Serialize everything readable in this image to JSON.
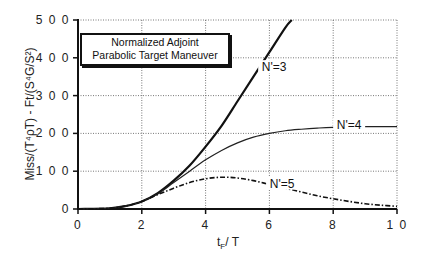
{
  "chart_data": {
    "type": "line",
    "title": "Normalized Adjoint Parabolic Target Maneuver",
    "title_lines": [
      "Normalized Adjoint",
      "Parabolic Target Maneuver"
    ],
    "xlabel": "t_F / T",
    "ylabel": "Miss/(T^4 ρ_T) - Ft/(S^4 G/S^2)",
    "xlim": [
      0,
      10
    ],
    "ylim": [
      0,
      500
    ],
    "xticks": [
      0,
      2,
      4,
      6,
      8,
      10
    ],
    "xtick_labels": [
      "0",
      "2",
      "4",
      "6",
      "8",
      "1 0"
    ],
    "yticks": [
      0,
      100,
      200,
      300,
      400,
      500
    ],
    "ytick_labels": [
      "0",
      "1 0 0",
      "2 0 0",
      "3 0 0",
      "4 0 0",
      "5 0 0"
    ],
    "grid": true,
    "legend": "inline curve labels",
    "series": [
      {
        "name": "N'=3",
        "style": "solid-thick",
        "x": [
          0,
          1,
          1.5,
          2,
          2.5,
          3,
          3.5,
          4,
          4.5,
          5,
          5.5,
          6,
          6.5,
          6.7
        ],
        "values": [
          0,
          2,
          8,
          20,
          42,
          75,
          115,
          165,
          220,
          285,
          350,
          415,
          480,
          500
        ]
      },
      {
        "name": "N'=4",
        "style": "solid-thin",
        "x": [
          0,
          1,
          1.5,
          2,
          2.5,
          3,
          3.5,
          4,
          4.5,
          5,
          5.5,
          6,
          6.5,
          7,
          7.5,
          8,
          9,
          10
        ],
        "values": [
          0,
          2,
          8,
          20,
          40,
          70,
          100,
          130,
          155,
          175,
          190,
          200,
          207,
          211,
          214,
          216,
          218,
          218
        ]
      },
      {
        "name": "N'=5",
        "style": "dash-dot",
        "x": [
          0,
          1,
          1.5,
          2,
          2.5,
          3,
          3.5,
          4,
          4.5,
          5,
          5.5,
          6,
          6.5,
          7,
          7.5,
          8,
          8.5,
          9,
          9.5,
          10
        ],
        "values": [
          0,
          2,
          8,
          20,
          38,
          55,
          70,
          80,
          84,
          82,
          75,
          65,
          55,
          45,
          35,
          27,
          20,
          14,
          10,
          7
        ]
      }
    ],
    "annotations": [
      {
        "text": "N'=3",
        "x": 6.15,
        "y": 370
      },
      {
        "text": "N'=4",
        "x": 8.5,
        "y": 218
      },
      {
        "text": "N'=5",
        "x": 6.4,
        "y": 62
      }
    ]
  },
  "labels": {
    "title_line1": "Normalized Adjoint",
    "title_line2": "Parabolic Target Maneuver",
    "xlabel_main": "t",
    "xlabel_sub": "F",
    "xlabel_rest": "/ T",
    "ylabel": "Miss/(T⁴ρT)  -  Ft/(S⁴G/S²)",
    "curve3": "N'=3",
    "curve4": "N'=4",
    "curve5": "N'=5"
  }
}
